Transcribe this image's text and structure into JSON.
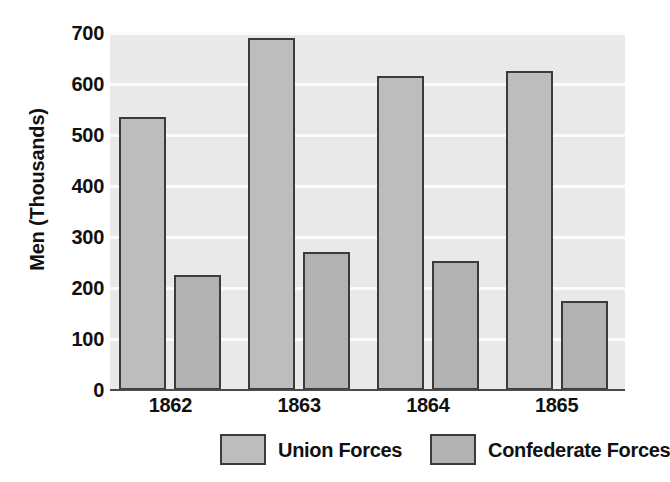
{
  "chart_data": {
    "type": "bar",
    "title": "",
    "xlabel": "",
    "ylabel": "Men (Thousands)",
    "categories": [
      "1862",
      "1863",
      "1864",
      "1865"
    ],
    "series": [
      {
        "name": "Union Forces",
        "values": [
          535,
          690,
          615,
          625
        ]
      },
      {
        "name": "Confederate Forces",
        "values": [
          225,
          270,
          253,
          175
        ]
      }
    ],
    "ylim": [
      0,
      700
    ],
    "ytick_labels": [
      "0",
      "100",
      "200",
      "300",
      "400",
      "500",
      "600",
      "700"
    ],
    "ytick_values": [
      0,
      100,
      200,
      300,
      400,
      500,
      600,
      700
    ],
    "grid": true,
    "legend_position": "bottom",
    "colors": {
      "plot_background": "#e9e9e9",
      "gridline": "#fbfbfb",
      "union_bar": "#bdbdbd",
      "confederate_bar": "#b2b2b2",
      "bar_border": "#3b3b3b",
      "axis": "#4a4a4a",
      "text": "#111111"
    }
  },
  "legend": {
    "entries": [
      {
        "label": "Union Forces"
      },
      {
        "label": "Confederate Forces"
      }
    ]
  }
}
